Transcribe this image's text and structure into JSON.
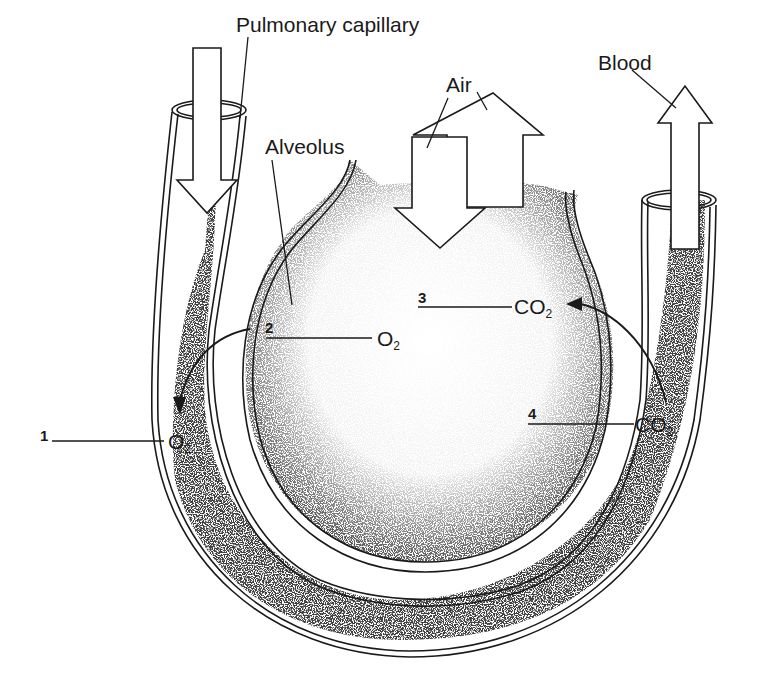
{
  "diagram": {
    "type": "pulmonary gas exchange illustration",
    "colors": {
      "line": "#1a1a1a",
      "stipple": "#2a2a2a",
      "background": "#ffffff"
    },
    "labels": {
      "pulmonary_capillary": "Pulmonary capillary",
      "alveolus": "Alveolus",
      "air": "Air",
      "blood": "Blood"
    },
    "markers": [
      {
        "number": "1",
        "molecule": "O",
        "subscript": "2"
      },
      {
        "number": "2",
        "molecule": "O",
        "subscript": "2"
      },
      {
        "number": "3",
        "molecule": "CO",
        "subscript": "2"
      },
      {
        "number": "4",
        "molecule": "CO",
        "subscript": "2"
      }
    ],
    "arrows": {
      "air_in": "down",
      "air_out": "up",
      "blood_in": "down",
      "blood_out": "up",
      "o2_diffusion": "alveolus to capillary",
      "co2_diffusion": "capillary to alveolus"
    }
  }
}
